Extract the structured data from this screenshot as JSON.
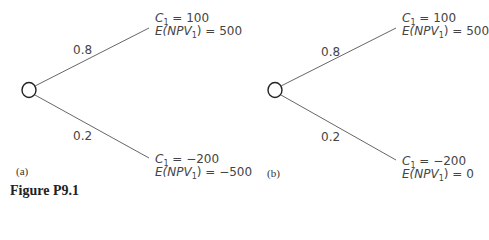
{
  "figure": {
    "caption": "Figure P9.1"
  },
  "panels": [
    {
      "id": "a",
      "label": "(a)",
      "branches": [
        {
          "probability": "0.8",
          "c_var": "C",
          "c_sub": "1",
          "c_value": "= 100",
          "e_prefix": "E(NPV",
          "e_sub": "1",
          "e_suffix": ") = 500"
        },
        {
          "probability": "0.2",
          "c_var": "C",
          "c_sub": "1",
          "c_value": "= −200",
          "e_prefix": "E(NPV",
          "e_sub": "1",
          "e_suffix": ") = −500"
        }
      ]
    },
    {
      "id": "b",
      "label": "(b)",
      "branches": [
        {
          "probability": "0.8",
          "c_var": "C",
          "c_sub": "1",
          "c_value": "= 100",
          "e_prefix": "E(NPV",
          "e_sub": "1",
          "e_suffix": ") = 500"
        },
        {
          "probability": "0.2",
          "c_var": "C",
          "c_sub": "1",
          "c_value": "= −200",
          "e_prefix": "E(NPV",
          "e_sub": "1",
          "e_suffix": ") = 0"
        }
      ]
    }
  ],
  "colors": {
    "line": "#555555",
    "node": "#222222",
    "text": "#444444"
  }
}
